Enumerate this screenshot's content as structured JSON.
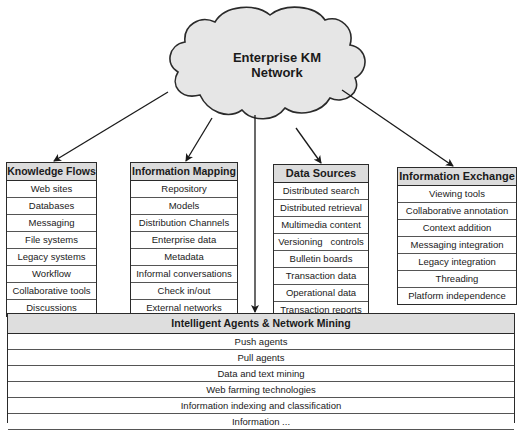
{
  "cloud": {
    "title_line1": "Enterprise KM",
    "title_line2": "Network",
    "fill": "#e6e6e6",
    "stroke": "#2a2a2a"
  },
  "boxes": {
    "knowledge_flows": {
      "title": "Knowledge Flows",
      "items": [
        "Web sites",
        "Databases",
        "Messaging",
        "File systems",
        "Legacy systems",
        "Workflow",
        "Collaborative tools",
        "Discussions"
      ]
    },
    "information_mapping": {
      "title": "Information Mapping",
      "items": [
        "Repository",
        "Models",
        "Distribution Channels",
        "Enterprise data",
        "Metadata",
        "Informal conversations",
        "Check in/out",
        "External networks"
      ]
    },
    "data_sources": {
      "title": "Data Sources",
      "items": [
        "Distributed search",
        "Distributed retrieval",
        "Multimedia content",
        "Versioning   controls",
        "Bulletin boards",
        "Transaction data",
        "Operational data",
        "Transaction reports"
      ]
    },
    "information_exchange": {
      "title": "Information Exchange",
      "items": [
        "Viewing tools",
        "Collaborative annotation",
        "Context addition",
        "Messaging integration",
        "Legacy integration",
        "Threading",
        "Platform independence"
      ]
    },
    "intelligent_agents": {
      "title": "Intelligent Agents & Network Mining",
      "items": [
        "Push agents",
        "Pull agents",
        "Data and text mining",
        "Web farming technologies",
        "Information indexing and classification",
        "Information ..."
      ]
    }
  },
  "colors": {
    "header_fill": "#dcdcdc",
    "line": "#2a2a2a"
  }
}
